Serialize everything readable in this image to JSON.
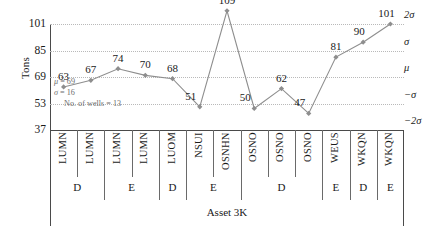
{
  "chart_data": {
    "type": "line",
    "title": "",
    "xlabel": "Asset 3K",
    "ylabel": "Tons",
    "ylim": [
      37,
      101
    ],
    "yticks": [
      37,
      53,
      69,
      85,
      101
    ],
    "grid": true,
    "legend": "none",
    "categories": [
      "LUMN",
      "LUMN",
      "LUMN",
      "LUMN",
      "LUOM",
      "NSUI",
      "OSNHN",
      "OSNO",
      "OSNO",
      "OSNO",
      "WEUS",
      "WKQN",
      "WKQN"
    ],
    "values": [
      63,
      67,
      74,
      70,
      68,
      51,
      109,
      50,
      62,
      47,
      81,
      90,
      101
    ],
    "point_labels": [
      "63",
      "67",
      "74",
      "70",
      "68",
      "51",
      "109",
      "50",
      "62",
      "47",
      "81",
      "90",
      "101"
    ],
    "series": [
      {
        "name": "Tons",
        "values": [
          63,
          67,
          74,
          70,
          68,
          51,
          109,
          50,
          62,
          47,
          81,
          90,
          101
        ],
        "color": "#8e8e8e"
      }
    ],
    "sigma_lines": [
      {
        "label": "2σ",
        "value": 101
      },
      {
        "label": "σ",
        "value": 85
      },
      {
        "label": "μ",
        "value": 69
      },
      {
        "label": "−σ",
        "value": 53
      },
      {
        "label": "−2σ",
        "value": 37
      }
    ],
    "groups": [
      {
        "label": "D",
        "span": 2
      },
      {
        "label": "E",
        "span": 2
      },
      {
        "label": "D",
        "span": 1
      },
      {
        "label": "E",
        "span": 2
      },
      {
        "label": "D",
        "span": 3
      },
      {
        "label": "E",
        "span": 1
      },
      {
        "label": "D",
        "span": 1
      },
      {
        "label": "E",
        "span": 1
      }
    ],
    "annotation": {
      "mu_symbol": "μ",
      "mu_text": " = 69",
      "sigma_symbol": "σ",
      "sigma_text": " = 16",
      "wells_text": "No. of wells = 13"
    }
  },
  "colors": {
    "line": "#8e8e8e",
    "marker": "#8e8e8e",
    "axis": "#4a4a4a",
    "grid": "#b9b9b9",
    "text": "#1a1a1a",
    "annotation": "#6e6e6e"
  }
}
